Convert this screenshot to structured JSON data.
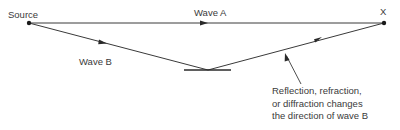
{
  "labels": {
    "source": "Source",
    "destination": "X",
    "wave_a": "Wave A",
    "wave_b": "Wave B"
  },
  "annotation": {
    "lines": [
      "Reflection, refraction,",
      "or diffraction changes",
      "the direction of wave B"
    ]
  },
  "colors": {
    "line": "#3a3a3a",
    "text": "#3a3a3a"
  }
}
